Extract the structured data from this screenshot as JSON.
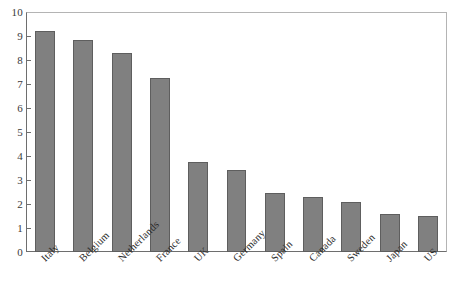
{
  "chart_data": {
    "type": "bar",
    "title": "",
    "subtitle": "",
    "xlabel": "",
    "ylabel": "",
    "ylim": [
      0,
      10
    ],
    "yticks": [
      0,
      1,
      2,
      3,
      4,
      5,
      6,
      7,
      8,
      9,
      10
    ],
    "ytick_labels": [
      "0",
      "1",
      "2",
      "3",
      "4",
      "5",
      "6",
      "7",
      "8",
      "9",
      "10"
    ],
    "grid": false,
    "legend": null,
    "orientation": "vertical",
    "categories": [
      "Italy",
      "Belgium",
      "Netherlands",
      "France",
      "UK",
      "Germany",
      "Spain",
      "Canada",
      "Sweden",
      "Japan",
      "US"
    ],
    "values": [
      9.2,
      8.85,
      8.3,
      7.25,
      3.75,
      3.4,
      2.45,
      2.3,
      2.1,
      1.58,
      1.48
    ],
    "bar_color": "#808080",
    "bar_edge_color": "#5e5e5e",
    "background_color": "#ffffff",
    "axis_color": "#6e6e6e",
    "label_rotation": -45
  },
  "axis": {
    "y_axis_name": "y-axis",
    "x_axis_name": "x-axis"
  }
}
